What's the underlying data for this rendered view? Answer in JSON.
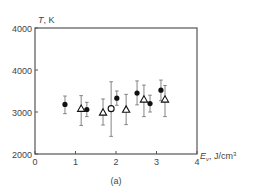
{
  "chart_data": {
    "type": "scatter",
    "title": "",
    "caption": "(a)",
    "xlabel": "E_v, J/cm3",
    "xlabel_parts": {
      "main": "E",
      "sub": "v",
      "unit": ", J/cm",
      "sup": "3"
    },
    "ylabel": "T, K",
    "xlim": [
      0,
      4
    ],
    "ylim": [
      2000,
      5000
    ],
    "x_ticks": [
      0,
      1,
      2,
      3,
      4
    ],
    "y_ticks": [
      {
        "value": 2000,
        "label": "2000"
      },
      {
        "value": 3000,
        "label": "3000"
      },
      {
        "value": 4000,
        "label": "4000"
      },
      {
        "value": 5000,
        "label": "4000"
      }
    ],
    "grid": false,
    "legend": null,
    "series": [
      {
        "name": "filled circles",
        "marker": "circle-filled",
        "points": [
          {
            "x": 0.74,
            "y": 3180,
            "err_low": 2960,
            "err_high": 3380
          },
          {
            "x": 1.28,
            "y": 3060,
            "err_low": 2890,
            "err_high": 3230
          },
          {
            "x": 2.02,
            "y": 3330,
            "err_low": 3160,
            "err_high": 3500
          },
          {
            "x": 2.52,
            "y": 3450,
            "err_low": 3170,
            "err_high": 3740
          },
          {
            "x": 2.84,
            "y": 3200,
            "err_low": 3000,
            "err_high": 3400
          },
          {
            "x": 3.11,
            "y": 3520,
            "err_low": 3270,
            "err_high": 3760
          }
        ]
      },
      {
        "name": "open triangles",
        "marker": "triangle-open",
        "points": [
          {
            "x": 1.14,
            "y": 3080,
            "err_low": 2680,
            "err_high": 3390
          },
          {
            "x": 1.68,
            "y": 2990,
            "err_low": 2690,
            "err_high": 3310
          },
          {
            "x": 2.25,
            "y": 3060,
            "err_low": 2700,
            "err_high": 3420
          },
          {
            "x": 2.69,
            "y": 3300,
            "err_low": 2890,
            "err_high": 3640
          },
          {
            "x": 3.21,
            "y": 3300,
            "err_low": 2890,
            "err_high": 3630
          }
        ]
      },
      {
        "name": "open circle",
        "marker": "circle-open",
        "points": [
          {
            "x": 1.88,
            "y": 3080,
            "err_low": 2420,
            "err_high": 3720
          }
        ]
      }
    ]
  },
  "colors": {
    "axis": "#555555",
    "marker": "#111111",
    "errorbar": "#777777",
    "text": "#444444"
  }
}
